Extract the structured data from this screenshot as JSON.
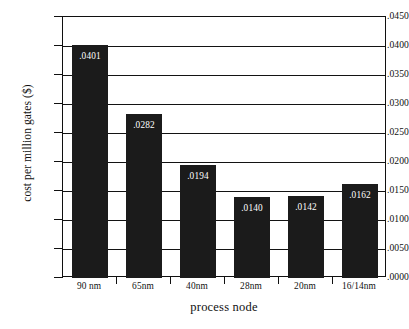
{
  "chart_data": {
    "type": "bar",
    "title": "",
    "xlabel": "process node",
    "ylabel": "cost per million gates ($)",
    "categories": [
      "90 nm",
      "65nm",
      "40nm",
      "28nm",
      "20nm",
      "16/14nm"
    ],
    "values": [
      0.0401,
      0.0282,
      0.0194,
      0.014,
      0.0142,
      0.0162
    ],
    "value_labels": [
      ".0401",
      ".0282",
      ".0194",
      ".0140",
      ".0142",
      ".0162"
    ],
    "ylim": [
      0.0,
      0.045
    ],
    "ytick_values": [
      0.0,
      0.005,
      0.01,
      0.015,
      0.02,
      0.025,
      0.03,
      0.035,
      0.04,
      0.045
    ],
    "ytick_labels": [
      ".0000",
      ".0050",
      ".0100",
      ".0150",
      ".0200",
      ".0250",
      ".0300",
      ".0350",
      ".0400",
      ".0450"
    ],
    "grid": true,
    "grid_axis": "y",
    "legend": false,
    "bar_color": "#1b1b1b",
    "label_color": "#ffffff",
    "axis_color": "#101010",
    "background": "#ffffff"
  }
}
